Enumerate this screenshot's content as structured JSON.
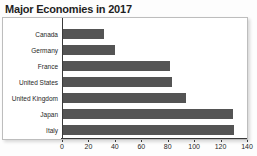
{
  "colors": {
    "bar": "#545454",
    "axis": "#3a3a3a",
    "plot_border": "#bdbdbd",
    "title_text": "#1f1f1f",
    "label_text": "#262626"
  },
  "chart_data": {
    "type": "bar",
    "orientation": "horizontal",
    "title": "Major Economies in 2017",
    "categories": [
      "Canada",
      "Germany",
      "France",
      "United States",
      "United Kingdom",
      "Japan",
      "Italy"
    ],
    "values": [
      32,
      40,
      82,
      84,
      94,
      130,
      131
    ],
    "xlabel": "",
    "ylabel": "",
    "xlim": [
      0,
      140
    ],
    "x_ticks": [
      0,
      20,
      40,
      60,
      80,
      100,
      120,
      140
    ],
    "grid": false,
    "legend": false
  }
}
